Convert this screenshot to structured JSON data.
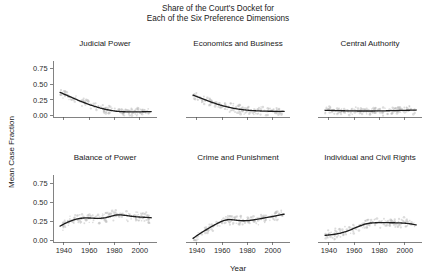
{
  "figure": {
    "title_line1": "Share of the Court's Docket for",
    "title_line2": "Each of the Six Preference Dimensions",
    "ylabel": "Mean Case Fraction",
    "xlabel": "Year"
  },
  "chart_data": {
    "type": "line",
    "xlabel": "Year",
    "ylabel": "Mean Case Fraction",
    "xlim": [
      1933,
      2012
    ],
    "ylim": [
      -0.02,
      0.85
    ],
    "xticks": [
      1940,
      1960,
      1980,
      2000
    ],
    "xtick_labels": [
      "1940",
      "1960",
      "1980",
      "2000"
    ],
    "yticks": [
      0.0,
      0.25,
      0.5,
      0.75
    ],
    "ytick_labels": [
      "0.00",
      "0.25",
      "0.50",
      "0.75"
    ],
    "grid": false,
    "legend": "none",
    "layout": "facet-grid 2 rows x 3 columns, shared axes",
    "line_color": "#1c1c1c",
    "point_color": "#b9b9b9",
    "panels": [
      {
        "name": "judicial-power",
        "title": "Judicial Power",
        "row": 0,
        "col": 0,
        "x": [
          1937,
          1941,
          1945,
          1949,
          1953,
          1957,
          1961,
          1965,
          1969,
          1973,
          1977,
          1981,
          1985,
          1989,
          1993,
          1997,
          2001,
          2005,
          2009
        ],
        "values": [
          0.37,
          0.335,
          0.3,
          0.265,
          0.23,
          0.2,
          0.17,
          0.145,
          0.12,
          0.1,
          0.085,
          0.072,
          0.065,
          0.062,
          0.06,
          0.06,
          0.062,
          0.064,
          0.066
        ]
      },
      {
        "name": "economics-and-business",
        "title": "Economics and Business",
        "row": 0,
        "col": 1,
        "x": [
          1937,
          1941,
          1945,
          1949,
          1953,
          1957,
          1961,
          1965,
          1969,
          1973,
          1977,
          1981,
          1985,
          1989,
          1993,
          1997,
          2001,
          2005,
          2009
        ],
        "values": [
          0.325,
          0.295,
          0.265,
          0.235,
          0.205,
          0.178,
          0.155,
          0.135,
          0.118,
          0.104,
          0.094,
          0.086,
          0.08,
          0.076,
          0.073,
          0.071,
          0.07,
          0.07,
          0.07
        ]
      },
      {
        "name": "central-authority",
        "title": "Central Authority",
        "row": 0,
        "col": 2,
        "x": [
          1937,
          1941,
          1945,
          1949,
          1953,
          1957,
          1961,
          1965,
          1969,
          1973,
          1977,
          1981,
          1985,
          1989,
          1993,
          1997,
          2001,
          2005,
          2009
        ],
        "values": [
          0.086,
          0.084,
          0.082,
          0.08,
          0.078,
          0.077,
          0.076,
          0.075,
          0.075,
          0.075,
          0.076,
          0.077,
          0.078,
          0.08,
          0.082,
          0.084,
          0.086,
          0.088,
          0.09
        ]
      },
      {
        "name": "balance-of-power",
        "title": "Balance of Power",
        "row": 1,
        "col": 0,
        "x": [
          1937,
          1941,
          1945,
          1949,
          1953,
          1957,
          1961,
          1965,
          1969,
          1973,
          1977,
          1981,
          1985,
          1989,
          1993,
          1997,
          2001,
          2005,
          2009
        ],
        "values": [
          0.19,
          0.225,
          0.255,
          0.278,
          0.292,
          0.298,
          0.296,
          0.292,
          0.292,
          0.3,
          0.318,
          0.336,
          0.338,
          0.33,
          0.32,
          0.312,
          0.308,
          0.305,
          0.3
        ]
      },
      {
        "name": "crime-and-punishment",
        "title": "Crime and Punishment",
        "row": 1,
        "col": 1,
        "x": [
          1937,
          1941,
          1945,
          1949,
          1953,
          1957,
          1961,
          1965,
          1969,
          1973,
          1977,
          1981,
          1985,
          1989,
          1993,
          1997,
          2001,
          2005,
          2009
        ],
        "values": [
          0.028,
          0.075,
          0.118,
          0.158,
          0.196,
          0.232,
          0.262,
          0.276,
          0.272,
          0.264,
          0.26,
          0.262,
          0.272,
          0.284,
          0.296,
          0.308,
          0.32,
          0.334,
          0.348
        ]
      },
      {
        "name": "individual-and-civil-rights",
        "title": "Individual and Civil Rights",
        "row": 1,
        "col": 2,
        "x": [
          1937,
          1941,
          1945,
          1949,
          1953,
          1957,
          1961,
          1965,
          1969,
          1973,
          1977,
          1981,
          1985,
          1989,
          1993,
          1997,
          2001,
          2005,
          2009
        ],
        "values": [
          0.068,
          0.074,
          0.083,
          0.096,
          0.115,
          0.14,
          0.168,
          0.196,
          0.218,
          0.23,
          0.234,
          0.235,
          0.235,
          0.234,
          0.233,
          0.231,
          0.227,
          0.218,
          0.205
        ]
      }
    ]
  }
}
